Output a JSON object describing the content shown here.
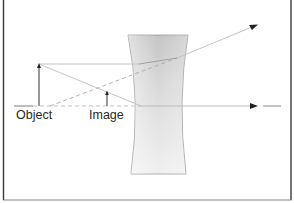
{
  "diagram": {
    "type": "ray diagram",
    "labels": {
      "object": "Object",
      "image": "Image"
    },
    "elements": [
      {
        "name": "optical-axis",
        "style": "dashed then solid",
        "arrow": "right"
      },
      {
        "name": "object-arrow",
        "direction": "up"
      },
      {
        "name": "image-arrow",
        "direction": "up",
        "kind": "virtual"
      },
      {
        "name": "concave-lens",
        "fill": "gray gradient"
      },
      {
        "name": "parallel-ray",
        "arrow": "up-right",
        "diverges_after_lens": true
      },
      {
        "name": "central-ray",
        "passes_through": "image tip"
      },
      {
        "name": "virtual-extension-ray",
        "style": "dashed",
        "traced_back_to": "focal point"
      }
    ],
    "colors": {
      "frame": "#3a3a3a",
      "ray": "#b8b8b8",
      "dashed_ray": "#a8a8a8",
      "arrow": "#222222",
      "lens_light": "#f2f2f2",
      "lens_dark": "#c8c8c8",
      "text": "#2a2a2a"
    }
  }
}
